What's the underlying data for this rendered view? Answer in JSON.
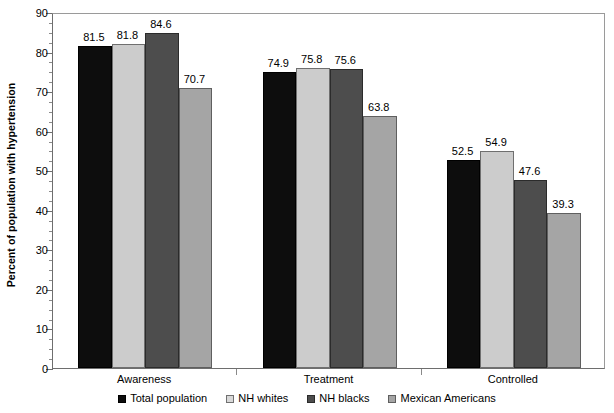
{
  "chart_data": {
    "type": "bar",
    "title": "",
    "xlabel": "",
    "ylabel": "Percent of population with hypertension",
    "ylim": [
      0,
      90
    ],
    "ytick_step": 10,
    "yticks": [
      0,
      10,
      20,
      30,
      40,
      50,
      60,
      70,
      80,
      90
    ],
    "ytick_labels": [
      "0",
      "10",
      "20",
      "30",
      "40",
      "50",
      "60",
      "70",
      "80",
      "90"
    ],
    "minor_tick_step": 2.5,
    "grid": false,
    "legend_position": "bottom",
    "categories": [
      "Awareness",
      "Treatment",
      "Controlled"
    ],
    "series": [
      {
        "name": "Total population",
        "color": "#0d0d0d",
        "values": [
          81.5,
          74.9,
          52.5
        ]
      },
      {
        "name": "NH whites",
        "color": "#cccccc",
        "values": [
          81.8,
          75.8,
          54.9
        ]
      },
      {
        "name": "NH blacks",
        "color": "#4d4d4d",
        "values": [
          84.6,
          75.6,
          47.6
        ]
      },
      {
        "name": "Mexican Americans",
        "color": "#a5a5a5",
        "values": [
          70.7,
          63.8,
          39.3
        ]
      }
    ],
    "value_labels": [
      [
        "81.5",
        "81.8",
        "84.6",
        "70.7"
      ],
      [
        "74.9",
        "75.8",
        "75.6",
        "63.8"
      ],
      [
        "52.5",
        "54.9",
        "47.6",
        "39.3"
      ]
    ]
  },
  "axis": {
    "y_title": "Percent of population with hypertension"
  },
  "legend": {
    "items": [
      {
        "label": "Total population"
      },
      {
        "label": "NH whites"
      },
      {
        "label": "NH blacks"
      },
      {
        "label": "Mexican Americans"
      }
    ]
  }
}
